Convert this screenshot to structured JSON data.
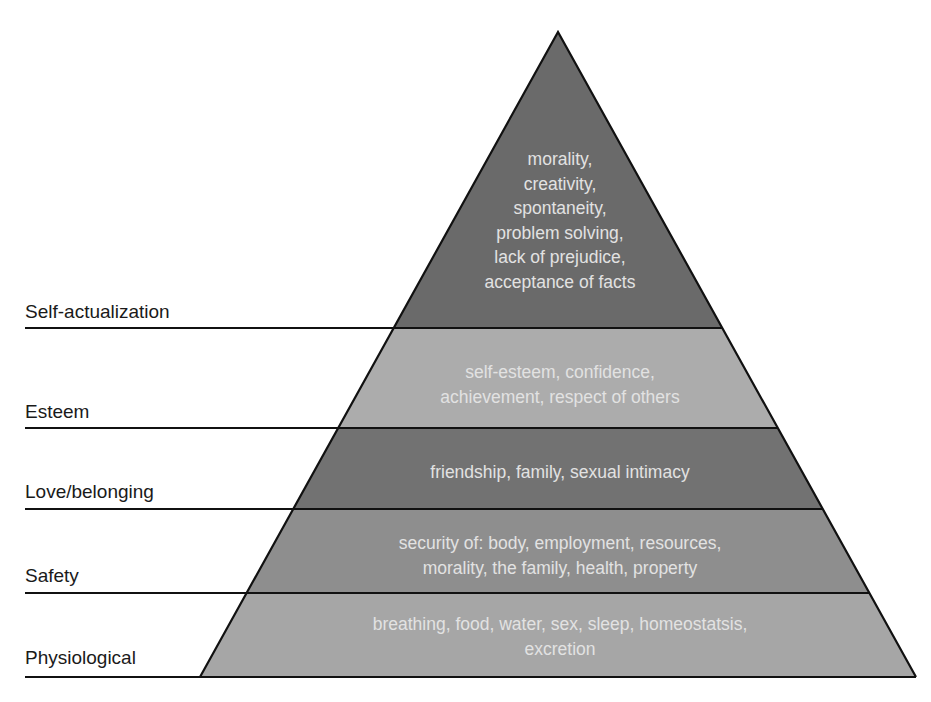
{
  "diagram": {
    "tiers": [
      {
        "name": "Self-actualization",
        "fill": "#6a6a6a",
        "lines": [
          "morality,",
          "creativity,",
          "spontaneity,",
          "problem solving,",
          "lack of prejudice,",
          "acceptance of facts"
        ]
      },
      {
        "name": "Esteem",
        "fill": "#acacac",
        "lines": [
          "self-esteem, confidence,",
          "achievement, respect of others"
        ]
      },
      {
        "name": "Love/belonging",
        "fill": "#727272",
        "lines": [
          "friendship, family, sexual intimacy"
        ]
      },
      {
        "name": "Safety",
        "fill": "#8e8e8e",
        "lines": [
          "security of: body, employment, resources,",
          "morality, the family, health, property"
        ]
      },
      {
        "name": "Physiological",
        "fill": "#a6a6a6",
        "lines": [
          "breathing, food, water, sex, sleep, homeostatsis,",
          "excretion"
        ]
      }
    ],
    "text_color": "#e2e2e2",
    "outline_color": "#111111"
  }
}
